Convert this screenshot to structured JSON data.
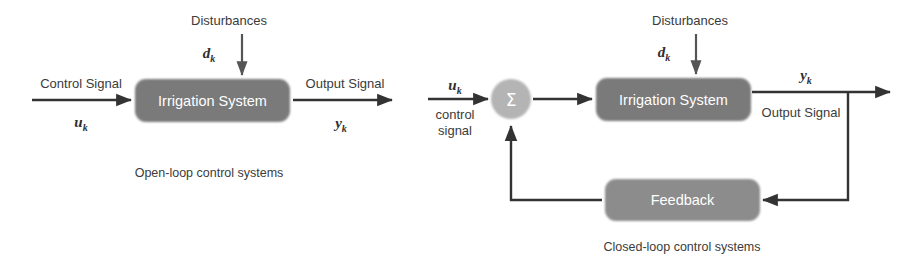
{
  "figure": {
    "colors": {
      "block_fill": "#7a7a7a",
      "block_fill_light": "#8c8c8c",
      "summing_fill": "#b4b4b4",
      "line": "#333333",
      "text": "#3b3b3b",
      "block_text": "#ffffff",
      "background": "#ffffff"
    }
  },
  "open_loop": {
    "caption": "Open-loop control systems",
    "plant_block": {
      "label": "Irrigation System"
    },
    "input": {
      "label": "Control Signal",
      "symbol": "u",
      "subscript": "k"
    },
    "output": {
      "label": "Output Signal",
      "symbol": "y",
      "subscript": "k"
    },
    "disturbance": {
      "label": "Disturbances",
      "symbol": "d",
      "subscript": "k"
    }
  },
  "closed_loop": {
    "caption": "Closed-loop control systems",
    "plant_block": {
      "label": "Irrigation System"
    },
    "feedback_block": {
      "label": "Feedback"
    },
    "summing_junction": {
      "label": "Σ"
    },
    "input": {
      "label_line1": "control",
      "label_line2": "signal",
      "symbol": "u",
      "subscript": "k"
    },
    "output": {
      "label": "Output Signal",
      "symbol": "y",
      "subscript": "k"
    },
    "disturbance": {
      "label": "Disturbances",
      "symbol": "d",
      "subscript": "k"
    }
  }
}
